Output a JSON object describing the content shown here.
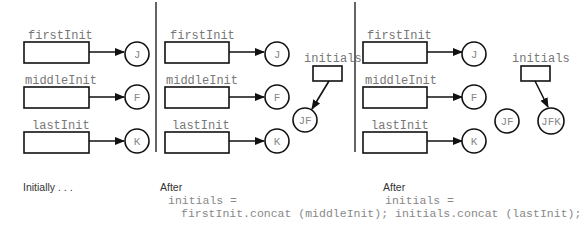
{
  "panels": [
    {
      "vars": [
        "firstInit",
        "middleInit",
        "lastInit"
      ],
      "values": [
        "J",
        "F",
        "K"
      ],
      "caption": "Initially . . ."
    },
    {
      "vars": [
        "firstInit",
        "middleInit",
        "lastInit"
      ],
      "values": [
        "J",
        "F",
        "K"
      ],
      "extra_var": "initials",
      "extra_value": "JF",
      "caption": "After",
      "code": [
        "initials =",
        "firstInit.concat (middleInit);"
      ]
    },
    {
      "vars": [
        "firstInit",
        "middleInit",
        "lastInit"
      ],
      "values": [
        "J",
        "F",
        "K"
      ],
      "extra_var": "initials",
      "orphan_value": "JF",
      "extra_value": "JFK",
      "caption": "After",
      "code": [
        "initials =",
        "initials.concat (lastInit);"
      ]
    }
  ]
}
